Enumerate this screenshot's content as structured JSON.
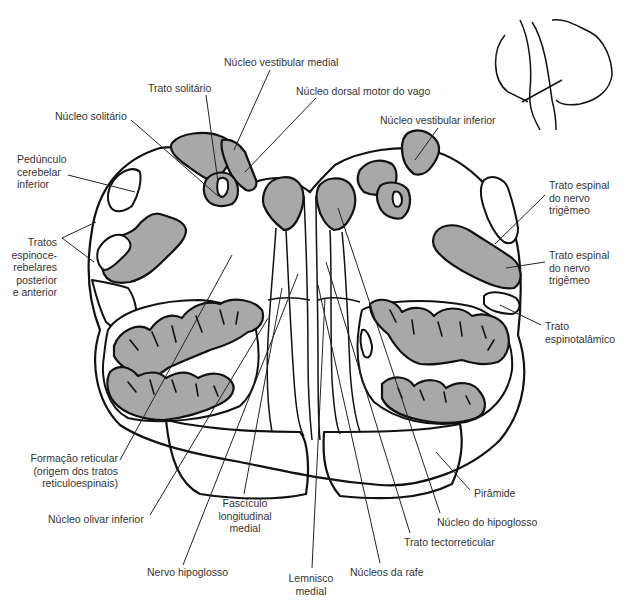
{
  "diagram": {
    "fill_gray": "#a8a8a8",
    "line_color": "#111111",
    "inset": "orientation-sketch-brainstem-cerebellum-with-cut-line"
  },
  "labels": {
    "nucleo_vestibular_medial": "Núcleo vestibular medial",
    "trato_solitario": "Trato solitário",
    "nucleo_dorsal_motor_vago": "Núcleo dorsal motor do vago",
    "nucleo_solitario": "Núcleo solitário",
    "nucleo_vestibular_inferior": "Núcleo vestibular inferior",
    "pedunculo": [
      "Pedúnculo",
      "cerebelar",
      "inferior"
    ],
    "tratos_espinocerebelares": [
      "Tratos",
      "espinoce-",
      "rebelares",
      "posterior",
      "e anterior"
    ],
    "trato_espinal_trigemeo_1": [
      "Trato espinal",
      "do nervo",
      "trigêmeo"
    ],
    "trato_espinal_trigemeo_2": [
      "Trato espinal",
      "do nervo",
      "trigêmeo"
    ],
    "trato_espinotalamico": [
      "Trato",
      "espinotalâmico"
    ],
    "formacao_reticular": [
      "Formação reticular",
      "(origem dos tratos",
      "reticuloespinais)"
    ],
    "nucleo_olivar_inferior": "Núcleo olivar inferior",
    "fasciculo_longitudinal_medial": [
      "Fascículo",
      "longitudinal",
      "medial"
    ],
    "nervo_hipoglosso": "Nervo hipoglosso",
    "lemnisco_medial": [
      "Lemnisco",
      "medial"
    ],
    "nucleos_da_rafe": "Núcleos da rafe",
    "trato_tectorreticular": "Trato tectorreticular",
    "nucleo_do_hipoglosso": "Núcleo do hipoglosso",
    "piramide": "Pirâmide"
  }
}
